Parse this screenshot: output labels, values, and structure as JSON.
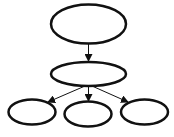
{
  "diagram": {
    "type": "tree",
    "stroke_color": "#111111",
    "background": "#ffffff",
    "nodes": [
      {
        "id": "root",
        "label": "",
        "cx": 88.5,
        "cy": 24,
        "rx": 38,
        "ry": 20
      },
      {
        "id": "middle",
        "label": "",
        "cx": 88.5,
        "cy": 74,
        "rx": 38,
        "ry": 12
      },
      {
        "id": "left-child",
        "label": "",
        "cx": 32,
        "cy": 112,
        "rx": 24,
        "ry": 12.5
      },
      {
        "id": "center-child",
        "label": "",
        "cx": 88,
        "cy": 114,
        "rx": 24,
        "ry": 12.5
      },
      {
        "id": "right-child",
        "label": "",
        "cx": 144.5,
        "cy": 112,
        "rx": 24,
        "ry": 12.5
      }
    ],
    "edges": [
      {
        "from": "root",
        "to": "middle"
      },
      {
        "from": "middle",
        "to": "left-child"
      },
      {
        "from": "middle",
        "to": "center-child"
      },
      {
        "from": "middle",
        "to": "right-child"
      }
    ]
  }
}
